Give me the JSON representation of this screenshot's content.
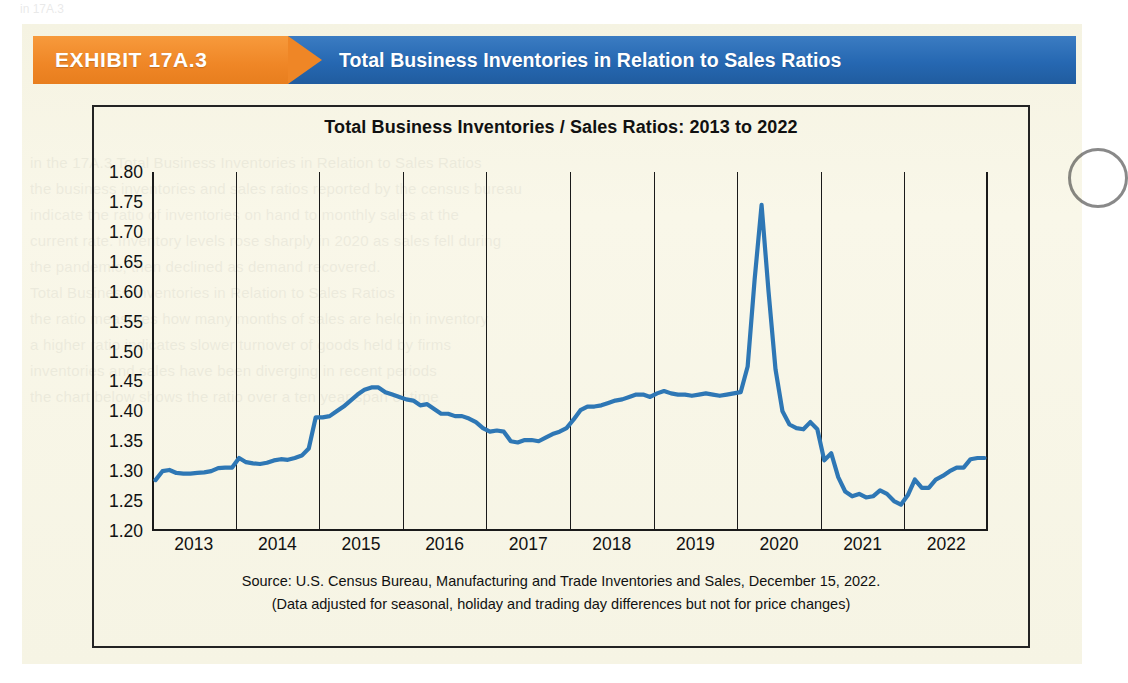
{
  "banner": {
    "exhibit_label": "EXHIBIT 17A.3",
    "title": "Total Business Inventories in Relation to Sales Ratios",
    "orange_hex": "#ef8626",
    "blue_hex": "#2668b2"
  },
  "chart": {
    "title": "Total Business Inventories / Sales Ratios: 2013 to 2022",
    "source_line1": "Source: U.S. Census Bureau, Manufacturing and Trade Inventories and Sales, December 15, 2022.",
    "source_line2": "(Data adjusted for seasonal, holiday and trading day differences but not for price changes)",
    "line_color": "#2e77b5",
    "background_hex": "#f7f5e4"
  },
  "ghost_text": [
    "in the 17A.3 Total Business Inventories in Relation to Sales Ratios",
    "the business inventories and sales ratios reported by the census bureau",
    "indicate the ratio of inventories on hand to monthly sales at the",
    "current rate. Inventory levels rose sharply in 2020 as sales fell during",
    "the pandemic, then declined as demand recovered.",
    "",
    "Total Business Inventories in Relation to Sales Ratios",
    "the ratio measures how many months of sales are held in inventory",
    "a higher ratio indicates slower turnover of goods held by firms",
    "",
    "inventories and sales have been diverging in recent periods",
    "",
    "the chart below shows the ratio over a ten year span of time"
  ],
  "chart_data": {
    "type": "line",
    "title": "Total Business Inventories / Sales Ratios: 2013 to 2022",
    "xlabel": "",
    "ylabel": "",
    "ylim": [
      1.2,
      1.8
    ],
    "ytick_labels": [
      "1.80",
      "1.75",
      "1.70",
      "1.65",
      "1.60",
      "1.55",
      "1.50",
      "1.45",
      "1.40",
      "1.35",
      "1.30",
      "1.25",
      "1.20"
    ],
    "ytick_values": [
      1.8,
      1.75,
      1.7,
      1.65,
      1.6,
      1.55,
      1.5,
      1.45,
      1.4,
      1.35,
      1.3,
      1.25,
      1.2
    ],
    "xtick_labels": [
      "2013",
      "2014",
      "2015",
      "2016",
      "2017",
      "2018",
      "2019",
      "2020",
      "2021",
      "2022"
    ],
    "grid": "vertical-year-boundaries",
    "legend": "none",
    "series": [
      {
        "name": "Total Business Inventories / Sales Ratio",
        "color": "#2e77b5",
        "values": [
          1.285,
          1.3,
          1.302,
          1.297,
          1.296,
          1.296,
          1.297,
          1.298,
          1.3,
          1.305,
          1.306,
          1.306,
          1.322,
          1.315,
          1.313,
          1.312,
          1.314,
          1.318,
          1.32,
          1.319,
          1.322,
          1.326,
          1.338,
          1.39,
          1.39,
          1.392,
          1.4,
          1.408,
          1.418,
          1.428,
          1.436,
          1.44,
          1.44,
          1.432,
          1.428,
          1.424,
          1.42,
          1.418,
          1.41,
          1.412,
          1.404,
          1.396,
          1.396,
          1.392,
          1.392,
          1.388,
          1.382,
          1.372,
          1.366,
          1.368,
          1.366,
          1.35,
          1.348,
          1.352,
          1.352,
          1.35,
          1.356,
          1.362,
          1.366,
          1.372,
          1.386,
          1.402,
          1.408,
          1.408,
          1.41,
          1.414,
          1.418,
          1.42,
          1.424,
          1.428,
          1.428,
          1.424,
          1.43,
          1.434,
          1.43,
          1.428,
          1.428,
          1.426,
          1.428,
          1.43,
          1.428,
          1.426,
          1.428,
          1.43,
          1.432,
          1.475,
          1.62,
          1.745,
          1.6,
          1.47,
          1.4,
          1.378,
          1.372,
          1.37,
          1.382,
          1.37,
          1.318,
          1.33,
          1.29,
          1.266,
          1.258,
          1.262,
          1.256,
          1.258,
          1.268,
          1.262,
          1.25,
          1.244,
          1.26,
          1.286,
          1.272,
          1.272,
          1.286,
          1.292,
          1.3,
          1.306,
          1.306,
          1.32,
          1.322,
          1.322
        ]
      }
    ]
  }
}
